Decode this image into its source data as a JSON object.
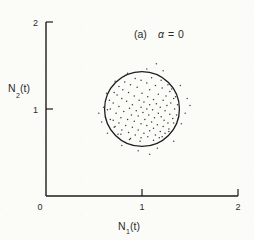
{
  "figure": {
    "panel_label": "(a)",
    "annotation": "α = 0",
    "alpha_symbol": "α",
    "alpha_value": "0",
    "alpha_equals": "=",
    "line_color": "#1c1c1c",
    "point_color": "#3a3a3a",
    "background_color": "#fbfbf8"
  },
  "axes": {
    "x_label_main": "N",
    "x_label_sub": "1",
    "x_label_tail": "(t)",
    "y_label_main": "N",
    "y_label_sub": "2",
    "y_label_tail": "(t)",
    "origin_label": "0",
    "x_ticks": [
      "1",
      "2"
    ],
    "y_ticks": [
      "1",
      "2"
    ]
  },
  "chart_data": {
    "type": "scatter",
    "title": "(a) α = 0",
    "xlabel": "N₁(t)",
    "ylabel": "N₂(t)",
    "xlim": [
      0,
      2
    ],
    "ylim": [
      0,
      2
    ],
    "xticks": [
      0,
      1,
      2
    ],
    "yticks": [
      0,
      1,
      2
    ],
    "grid": false,
    "legend": null,
    "annotations": [
      {
        "text": "(a) α = 0",
        "x": 1.12,
        "y": 1.82
      }
    ],
    "overlay_shapes": [
      {
        "type": "circle",
        "center": [
          1.0,
          1.0
        ],
        "radius": 0.39,
        "stroke": "#1c1c1c",
        "fill": "none",
        "linewidth": 1.3
      }
    ],
    "series": [
      {
        "name": "trajectory samples",
        "marker": "dot",
        "color": "#3a3a3a",
        "points": [
          [
            0.99,
            1.33
          ],
          [
            1.05,
            1.3
          ],
          [
            0.88,
            1.28
          ],
          [
            1.14,
            1.27
          ],
          [
            0.95,
            1.25
          ],
          [
            1.21,
            1.24
          ],
          [
            0.8,
            1.22
          ],
          [
            1.08,
            1.22
          ],
          [
            1.29,
            1.2
          ],
          [
            0.86,
            1.19
          ],
          [
            1.0,
            1.18
          ],
          [
            1.17,
            1.17
          ],
          [
            0.74,
            1.16
          ],
          [
            1.25,
            1.15
          ],
          [
            0.92,
            1.15
          ],
          [
            1.06,
            1.14
          ],
          [
            1.33,
            1.12
          ],
          [
            0.79,
            1.12
          ],
          [
            1.12,
            1.11
          ],
          [
            0.97,
            1.1
          ],
          [
            1.22,
            1.1
          ],
          [
            0.84,
            1.09
          ],
          [
            1.02,
            1.08
          ],
          [
            1.3,
            1.07
          ],
          [
            0.7,
            1.07
          ],
          [
            1.15,
            1.06
          ],
          [
            0.9,
            1.05
          ],
          [
            1.08,
            1.05
          ],
          [
            1.26,
            1.04
          ],
          [
            0.76,
            1.03
          ],
          [
            0.99,
            1.02
          ],
          [
            1.19,
            1.02
          ],
          [
            0.87,
            1.01
          ],
          [
            1.05,
            1.0
          ],
          [
            1.34,
            1.0
          ],
          [
            0.67,
            1.0
          ],
          [
            1.11,
            0.99
          ],
          [
            0.94,
            0.98
          ],
          [
            1.24,
            0.98
          ],
          [
            0.81,
            0.97
          ],
          [
            1.01,
            0.96
          ],
          [
            1.17,
            0.95
          ],
          [
            0.73,
            0.95
          ],
          [
            1.29,
            0.94
          ],
          [
            0.89,
            0.93
          ],
          [
            1.07,
            0.93
          ],
          [
            0.96,
            0.92
          ],
          [
            1.2,
            0.91
          ],
          [
            0.78,
            0.9
          ],
          [
            1.13,
            0.9
          ],
          [
            1.32,
            0.89
          ],
          [
            0.85,
            0.88
          ],
          [
            1.03,
            0.88
          ],
          [
            1.23,
            0.87
          ],
          [
            0.7,
            0.87
          ],
          [
            0.92,
            0.86
          ],
          [
            1.1,
            0.85
          ],
          [
            1.27,
            0.84
          ],
          [
            0.76,
            0.84
          ],
          [
            0.99,
            0.83
          ],
          [
            1.16,
            0.82
          ],
          [
            0.83,
            0.81
          ],
          [
            1.05,
            0.81
          ],
          [
            1.22,
            0.8
          ],
          [
            0.72,
            0.8
          ],
          [
            0.9,
            0.79
          ],
          [
            1.12,
            0.78
          ],
          [
            1.28,
            0.77
          ],
          [
            0.96,
            0.76
          ],
          [
            0.79,
            0.76
          ],
          [
            1.08,
            0.75
          ],
          [
            1.19,
            0.74
          ],
          [
            0.86,
            0.73
          ],
          [
            1.02,
            0.72
          ],
          [
            1.24,
            0.72
          ],
          [
            0.93,
            0.7
          ],
          [
            1.14,
            0.7
          ],
          [
            0.75,
            0.71
          ],
          [
            1.06,
            0.68
          ],
          [
            0.99,
            0.67
          ],
          [
            1.18,
            0.67
          ],
          [
            0.88,
            0.66
          ],
          [
            1.1,
            1.36
          ],
          [
            0.93,
            1.35
          ],
          [
            1.2,
            1.33
          ],
          [
            0.82,
            1.31
          ],
          [
            1.27,
            1.28
          ],
          [
            0.76,
            1.26
          ],
          [
            1.31,
            1.23
          ],
          [
            0.71,
            1.19
          ],
          [
            1.35,
            1.14
          ],
          [
            0.66,
            1.1
          ],
          [
            1.37,
            1.05
          ],
          [
            0.64,
            0.99
          ],
          [
            1.36,
            0.93
          ],
          [
            0.67,
            0.88
          ],
          [
            1.33,
            0.84
          ],
          [
            0.71,
            0.79
          ],
          [
            1.28,
            0.74
          ],
          [
            0.78,
            0.71
          ],
          [
            1.21,
            0.68
          ],
          [
            0.87,
            0.65
          ],
          [
            1.12,
            0.64
          ],
          [
            0.98,
            0.63
          ]
        ]
      },
      {
        "name": "outliers",
        "marker": "dot",
        "color": "#4a4a4a",
        "points": [
          [
            1.15,
            1.52
          ],
          [
            1.22,
            1.44
          ],
          [
            1.4,
            1.27
          ],
          [
            1.47,
            1.12
          ],
          [
            1.45,
            0.95
          ],
          [
            1.41,
            0.83
          ],
          [
            1.33,
            0.63
          ],
          [
            1.16,
            0.55
          ],
          [
            0.96,
            0.52
          ],
          [
            0.79,
            0.58
          ],
          [
            0.64,
            0.72
          ],
          [
            0.58,
            0.85
          ],
          [
            0.6,
            1.02
          ],
          [
            0.63,
            1.18
          ],
          [
            0.72,
            1.32
          ],
          [
            0.85,
            1.41
          ],
          [
            1.05,
            1.46
          ],
          [
            1.5,
            1.04
          ],
          [
            0.55,
            0.95
          ],
          [
            1.08,
            0.48
          ]
        ]
      }
    ]
  }
}
